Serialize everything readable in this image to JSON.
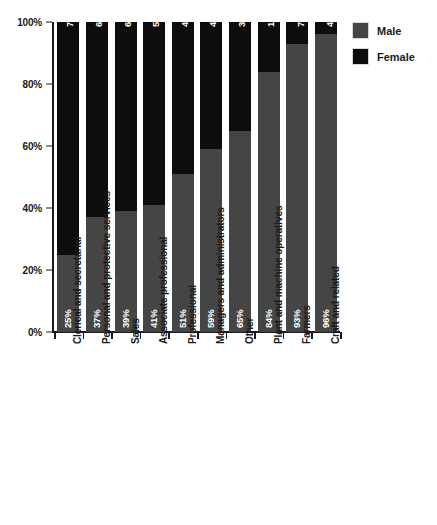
{
  "chart_data": {
    "type": "bar",
    "subtype": "stacked-bar-100-percent",
    "orientation": "vertical",
    "title": "",
    "xlabel": "",
    "ylabel": "",
    "ylim": [
      0,
      100
    ],
    "yticks": [
      "0%",
      "20%",
      "40%",
      "60%",
      "80%",
      "100%"
    ],
    "ytick_values": [
      0,
      20,
      40,
      60,
      80,
      100
    ],
    "grid": false,
    "legend_position": "right-top",
    "categories": [
      "Clerical and secretarial",
      "Personal and protective services",
      "Sales",
      "Associate professional",
      "Professional",
      "Managers and administrators",
      "Other",
      "Plant and machine operatives",
      "Farmers",
      "Craft and related"
    ],
    "series": [
      {
        "name": "Male",
        "color": "#454545",
        "values": [
          25,
          37,
          39,
          41,
          51,
          59,
          65,
          84,
          93,
          96
        ],
        "labels": [
          "25%",
          "37%",
          "39%",
          "41%",
          "51%",
          "59%",
          "65%",
          "84%",
          "93%",
          "96%"
        ]
      },
      {
        "name": "Female",
        "color": "#0d0d0d",
        "values": [
          75,
          63,
          61,
          59,
          49,
          41,
          35,
          16,
          7,
          4
        ],
        "labels": [
          "75%",
          "63%",
          "61%",
          "59%",
          "49%",
          "41%",
          "35%",
          "16%",
          "7%",
          "4%"
        ]
      }
    ]
  },
  "legend": {
    "items": [
      {
        "label": "Male",
        "color": "#454545"
      },
      {
        "label": "Female",
        "color": "#0d0d0d"
      }
    ]
  }
}
